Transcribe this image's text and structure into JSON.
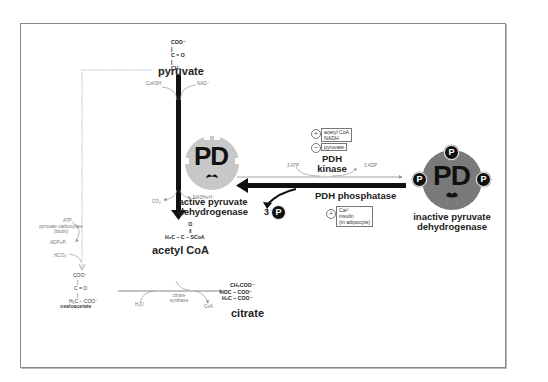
{
  "diagram": {
    "colors": {
      "main_arrow": "#111111",
      "active_enzyme_fill": "#c8c8c8",
      "inactive_enzyme_fill": "#7a7a7a",
      "frame_border": "#8a8a8a",
      "minor_text": "#777777"
    },
    "pyruvate": {
      "structure": [
        "COO⁻",
        "C = O",
        "CH₃"
      ],
      "label": "pyruvate"
    },
    "pdh_reaction": {
      "cofactor_in_left": "CoASH",
      "cofactor_in_right": "NAD⁺",
      "product_left": "CO₂",
      "product_right": "NADH+H⁺"
    },
    "acetyl_coa": {
      "structure": [
        "O",
        "‖",
        "H₃C − C − SCoA"
      ],
      "label": "acetyl CoA"
    },
    "pyruvate_carboxylase": {
      "atp": "ATP",
      "enzyme": "pyruvate carboxylase",
      "cofactor": "(biotin)",
      "adp": "ADP+Pᵢ",
      "hco3": "HCO₃⁻"
    },
    "oxaloacetate": {
      "structure": [
        "COO⁻",
        "|",
        "C = O",
        "|",
        "H₂C − COO⁻"
      ],
      "label": "oxaloacetate"
    },
    "citrate_synthase": {
      "water": "H₂O",
      "enzyme": "citrate synthase",
      "coa": "CoA"
    },
    "citrate": {
      "structure": [
        "CH₂COO⁻",
        "HOC − COO⁻",
        "H₂C − COO⁻"
      ],
      "label": "citrate"
    },
    "active_enzyme": {
      "letters": "PD",
      "label_line1": "active pyruvate",
      "label_line2": "dehydrogenase"
    },
    "inactive_enzyme": {
      "letters": "PD",
      "phosphate_symbol": "P",
      "label_line1": "inactive pyruvate",
      "label_line2": "dehydrogenase"
    },
    "kinase": {
      "label_line1": "PDH",
      "label_line2": "kinase",
      "atp": "3 ATP",
      "adp": "3 ADP",
      "activators_sign": "+",
      "activators": [
        "acetyl CoA",
        "NADH"
      ],
      "inhibitors_sign": "−",
      "inhibitors": [
        "pyruvate"
      ]
    },
    "phosphatase": {
      "label": "PDH phosphatase",
      "released_count": "3",
      "released_symbol": "P",
      "activators_sign": "+",
      "activators": [
        "Ca²⁺",
        "insulin",
        "(in adipocyte)"
      ]
    }
  }
}
